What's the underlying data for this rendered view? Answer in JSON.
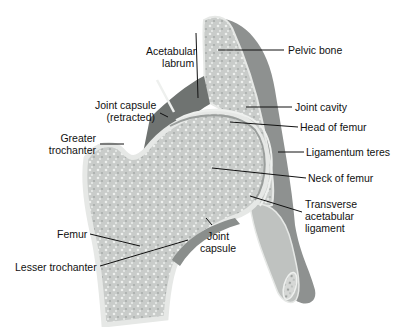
{
  "diagram": {
    "labels": {
      "acetabular_labrum": "Acetabular\nlabrum",
      "acetabular_labrum_l1": "Acetabular",
      "acetabular_labrum_l2": "labrum",
      "pelvic_bone": "Pelvic bone",
      "joint_capsule_retracted_l1": "Joint capsule",
      "joint_capsule_retracted_l2": "(retracted)",
      "joint_cavity": "Joint cavity",
      "head_of_femur": "Head of femur",
      "greater_trochanter_l1": "Greater",
      "greater_trochanter_l2": "trochanter",
      "ligamentum_teres": "Ligamentum teres",
      "neck_of_femur": "Neck of femur",
      "transverse_acetabular_ligament_l1": "Transverse",
      "transverse_acetabular_ligament_l2": "acetabular",
      "transverse_acetabular_ligament_l3": "ligament",
      "joint_capsule_l1": "Joint",
      "joint_capsule_l2": "capsule",
      "femur": "Femur",
      "lesser_trochanter": "Lesser trochanter"
    },
    "colors": {
      "bone_fill": "#cfd2d0",
      "bone_cortex": "#e6e8e6",
      "pelvis_shadow": "#8e9190",
      "capsule": "#6f7371",
      "leader_line": "#111111"
    }
  }
}
